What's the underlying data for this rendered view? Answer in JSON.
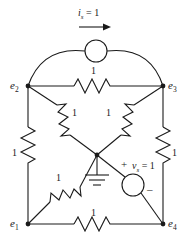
{
  "figure": {
    "type": "electrical-circuit-schematic",
    "line_color": "#1a1a1a",
    "background_color": "#ffffff"
  },
  "nodes": [
    {
      "id": "e1",
      "label": "e",
      "sub": "1",
      "x": 28,
      "y": 224,
      "label_x": 10,
      "label_y": 218
    },
    {
      "id": "e2",
      "label": "e",
      "sub": "2",
      "x": 28,
      "y": 86,
      "label_x": 10,
      "label_y": 80
    },
    {
      "id": "e3",
      "label": "e",
      "sub": "3",
      "x": 163,
      "y": 86,
      "label_x": 168,
      "label_y": 80
    },
    {
      "id": "e4",
      "label": "e",
      "sub": "4",
      "x": 163,
      "y": 224,
      "label_x": 168,
      "label_y": 218
    },
    {
      "id": "center",
      "label": "",
      "sub": "",
      "x": 97,
      "y": 155,
      "label_x": 0,
      "label_y": 0
    }
  ],
  "resistors": [
    {
      "id": "r-top",
      "value": "1",
      "label_x": 91,
      "label_y": 66,
      "between": [
        "e2",
        "e3"
      ]
    },
    {
      "id": "r-left",
      "value": "1",
      "label_x": 12,
      "label_y": 148,
      "between": [
        "e2",
        "e1"
      ]
    },
    {
      "id": "r-right",
      "value": "1",
      "label_x": 172,
      "label_y": 148,
      "between": [
        "e3",
        "e4"
      ]
    },
    {
      "id": "r-bottom",
      "value": "1",
      "label_x": 91,
      "label_y": 208,
      "between": [
        "e1",
        "e4"
      ]
    },
    {
      "id": "r-e2-center",
      "value": "1",
      "label_x": 72,
      "label_y": 108,
      "between": [
        "e2",
        "center"
      ]
    },
    {
      "id": "r-e3-center",
      "value": "1",
      "label_x": 106,
      "label_y": 108,
      "between": [
        "e3",
        "center"
      ]
    },
    {
      "id": "r-e1-center",
      "value": "1",
      "label_x": 56,
      "label_y": 173,
      "between": [
        "e1",
        "center"
      ]
    }
  ],
  "current_source": {
    "id": "is",
    "symbol": "i",
    "sub": "s",
    "equals": "= 1",
    "full_label": "i_s = 1",
    "label_x": 78,
    "label_y": 8,
    "circle_cx": 96,
    "circle_cy": 51,
    "circle_r": 11,
    "arrow": {
      "x1": 79,
      "y1": 27,
      "x2": 109,
      "y2": 27
    }
  },
  "voltage_source": {
    "id": "vs",
    "symbol": "v",
    "sub": "s",
    "equals": "= 1",
    "full_label": "v_s = 1",
    "label_x": 132,
    "label_y": 161,
    "plus_sign": "+",
    "plus_x": 121,
    "plus_y": 160,
    "minus_sign": "–",
    "minus_x": 147,
    "minus_y": 186,
    "circle_cx": 133,
    "circle_cy": 185,
    "circle_r": 11
  },
  "ground": {
    "id": "ground",
    "x": 97,
    "y": 155,
    "stem_length": 20,
    "bars": 3
  }
}
